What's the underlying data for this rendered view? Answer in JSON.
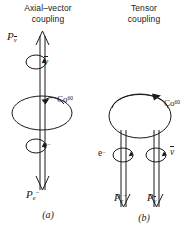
{
  "figure": {
    "kind": "physics-diagram",
    "stroke_color": "#1a1a1a",
    "background_color": "#ffffff"
  },
  "panels": [
    {
      "id": "a",
      "title_line1": "Axial–vector",
      "title_line2": "coupling",
      "caption": "(a)",
      "nucleus_label": {
        "element": "Co",
        "mass_number": "60"
      },
      "momentum_up": {
        "symbol": "P",
        "subscript": "ν",
        "subscript_has_bar": true,
        "direction": "up"
      },
      "momentum_down": {
        "symbol": "P",
        "subscript": "e",
        "subscript_superscript": "−",
        "direction": "down"
      },
      "spin_labels": [
        {
          "symbol": "ν",
          "has_bar": true,
          "position": "upper"
        },
        {
          "symbol": "e",
          "superscript": "−",
          "position": "lower"
        }
      ]
    },
    {
      "id": "b",
      "title_line1": "Tensor",
      "title_line2": "coupling",
      "caption": "(b)",
      "nucleus_label": {
        "element": "Co",
        "mass_number": "60"
      },
      "momentum_left": {
        "symbol": "P",
        "subscript": "e",
        "subscript_superscript": "−",
        "direction": "down"
      },
      "momentum_right": {
        "symbol": "P",
        "subscript": "ν",
        "subscript_has_bar": true,
        "direction": "down"
      },
      "spin_labels": [
        {
          "symbol": "e",
          "superscript": "−",
          "position": "left"
        },
        {
          "symbol": "ν",
          "has_bar": true,
          "position": "right"
        }
      ]
    }
  ]
}
